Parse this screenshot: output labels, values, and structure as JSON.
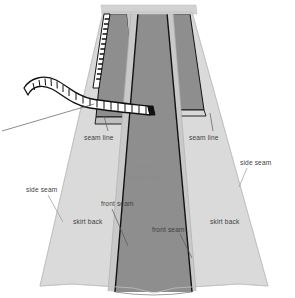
{
  "figure": {
    "type": "technical-sewing-illustration",
    "canvas": {
      "width": 295,
      "height": 298
    },
    "background_color": "#ffffff"
  },
  "colors": {
    "skirt_front_dark": "#8e8e8e",
    "skirt_back_light": "#dadada",
    "seam_allowance": "#c9c9c9",
    "waistband": "#d2d2d2",
    "outline": "#111111",
    "label_text": "#4c4c4c",
    "label_text_light": "#8d8d8d",
    "tape_fill": "#ffffff",
    "tape_outline": "#101010"
  },
  "labels": [
    {
      "id": "seam-line-left",
      "text": "seam line",
      "x": 84,
      "y": 137,
      "tone": "dark"
    },
    {
      "id": "seam-line-right",
      "text": "seam line",
      "x": 189,
      "y": 137,
      "tone": "dark"
    },
    {
      "id": "skirt-front",
      "text": "skirt front",
      "x": 128,
      "y": 168,
      "tone": "light"
    },
    {
      "id": "skirt-front-note",
      "text": "(wrong side)",
      "x": 125,
      "y": 178,
      "tone": "light"
    },
    {
      "id": "side-seam-right",
      "text": "side seam",
      "x": 240,
      "y": 163,
      "tone": "dark"
    },
    {
      "id": "side-seam-left",
      "text": "side seam",
      "x": 26,
      "y": 190,
      "tone": "dark"
    },
    {
      "id": "front-seam-left",
      "text": "front seam",
      "x": 101,
      "y": 204,
      "tone": "dark"
    },
    {
      "id": "skirt-back-left",
      "text": "skirt back",
      "x": 73,
      "y": 222,
      "tone": "dark"
    },
    {
      "id": "front-seam-right",
      "text": "front seam",
      "x": 155,
      "y": 230,
      "tone": "dark"
    },
    {
      "id": "skirt-back-right",
      "text": "skirt back",
      "x": 211,
      "y": 222,
      "tone": "dark"
    }
  ],
  "parts": {
    "waistband": "waistband-strip",
    "zipper": "zipper-basting-strip",
    "tape_measure": "tape-measure-ribbon",
    "center_panel": "skirt-front-panel",
    "left_panel": "skirt-back-left-panel",
    "right_panel": "skirt-back-right-panel"
  }
}
